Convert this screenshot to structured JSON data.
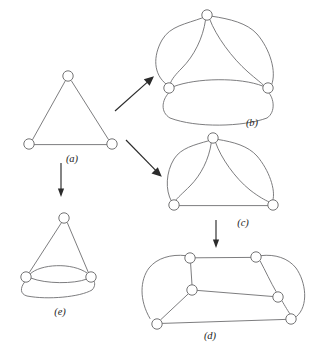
{
  "figure": {
    "background_color": "#ffffff",
    "edge_color": "#6e6e70",
    "node_color": "#ffffff",
    "node_stroke_color": "#6b6b6d",
    "arrow_color": "#2b2b2b",
    "label_color": "#1d1d1d",
    "node_radius": 5.2
  },
  "labels": {
    "a": "(a)",
    "b": "(b)",
    "c": "(c)",
    "d": "(d)",
    "e": "(e)"
  },
  "panels": [
    {
      "id": "a",
      "label": "(a)",
      "label_x": 72,
      "label_y": 162,
      "description": "simple triangle, three nodes, three single edges",
      "node_count": 3,
      "edge_count": 3,
      "nodes": [
        {
          "id": "a1",
          "cx": 68,
          "cy": 76
        },
        {
          "id": "a2",
          "cx": 29,
          "cy": 144
        },
        {
          "id": "a3",
          "cx": 112,
          "cy": 144
        }
      ],
      "edges": [
        {
          "from": "a1",
          "to": "a2",
          "kind": "straight"
        },
        {
          "from": "a1",
          "to": "a3",
          "kind": "straight"
        },
        {
          "from": "a2",
          "to": "a3",
          "kind": "straight"
        }
      ]
    },
    {
      "id": "b",
      "label": "(b)",
      "label_x": 252,
      "label_y": 126,
      "description": "triangle with every edge doubled (three pairs of parallel edges)",
      "node_count": 3,
      "edge_count": 6,
      "nodes": [
        {
          "id": "b1",
          "cx": 207,
          "cy": 15
        },
        {
          "id": "b2",
          "cx": 169,
          "cy": 88
        },
        {
          "id": "b3",
          "cx": 268,
          "cy": 88
        }
      ],
      "edges": [
        {
          "from": "b1",
          "to": "b2",
          "kind": "curve-left"
        },
        {
          "from": "b1",
          "to": "b2",
          "kind": "curve-right"
        },
        {
          "from": "b1",
          "to": "b3",
          "kind": "curve-left"
        },
        {
          "from": "b1",
          "to": "b3",
          "kind": "curve-right"
        },
        {
          "from": "b2",
          "to": "b3",
          "kind": "curve-up"
        },
        {
          "from": "b2",
          "to": "b3",
          "kind": "curve-down"
        }
      ]
    },
    {
      "id": "c",
      "label": "(c)",
      "label_x": 243,
      "label_y": 226,
      "description": "triangle with two upper edges doubled, base edge single",
      "node_count": 3,
      "edge_count": 5,
      "nodes": [
        {
          "id": "c1",
          "cx": 213,
          "cy": 138
        },
        {
          "id": "c2",
          "cx": 174,
          "cy": 205
        },
        {
          "id": "c3",
          "cx": 273,
          "cy": 205
        }
      ],
      "edges": [
        {
          "from": "c1",
          "to": "c2",
          "kind": "curve-left"
        },
        {
          "from": "c1",
          "to": "c2",
          "kind": "curve-right"
        },
        {
          "from": "c1",
          "to": "c3",
          "kind": "curve-left"
        },
        {
          "from": "c1",
          "to": "c3",
          "kind": "curve-right"
        },
        {
          "from": "c2",
          "to": "c3",
          "kind": "straight"
        }
      ]
    },
    {
      "id": "d",
      "label": "(d)",
      "label_x": 210,
      "label_y": 339,
      "description": "six-node expansion of (c) with outer enclosing curves",
      "node_count": 6,
      "edge_count": 9,
      "nodes": [
        {
          "id": "d1",
          "cx": 190,
          "cy": 258
        },
        {
          "id": "d2",
          "cx": 256,
          "cy": 257
        },
        {
          "id": "d3",
          "cx": 192,
          "cy": 290
        },
        {
          "id": "d4",
          "cx": 278,
          "cy": 297
        },
        {
          "id": "d5",
          "cx": 157,
          "cy": 324
        },
        {
          "id": "d6",
          "cx": 291,
          "cy": 319
        }
      ],
      "edges": [
        {
          "from": "d1",
          "to": "d2",
          "kind": "straight"
        },
        {
          "from": "d1",
          "to": "d3",
          "kind": "straight"
        },
        {
          "from": "d3",
          "to": "d4",
          "kind": "straight"
        },
        {
          "from": "d3",
          "to": "d5",
          "kind": "straight"
        },
        {
          "from": "d5",
          "to": "d6",
          "kind": "straight"
        },
        {
          "from": "d2",
          "to": "d4",
          "kind": "curve-right"
        },
        {
          "from": "d1",
          "to": "d5",
          "kind": "curve-left-outer"
        },
        {
          "from": "d2",
          "to": "d6",
          "kind": "curve-right-outer"
        },
        {
          "from": "d4",
          "to": "d6",
          "kind": "curve-right-inner"
        }
      ]
    },
    {
      "id": "e",
      "label": "(e)",
      "label_x": 60,
      "label_y": 315,
      "description": "triangle with base edge tripled",
      "node_count": 3,
      "edge_count": 5,
      "nodes": [
        {
          "id": "e1",
          "cx": 64,
          "cy": 218
        },
        {
          "id": "e2",
          "cx": 26,
          "cy": 277
        },
        {
          "id": "e3",
          "cx": 91,
          "cy": 277
        }
      ],
      "edges": [
        {
          "from": "e1",
          "to": "e2",
          "kind": "straight"
        },
        {
          "from": "e1",
          "to": "e3",
          "kind": "straight"
        },
        {
          "from": "e2",
          "to": "e3",
          "kind": "curve-up"
        },
        {
          "from": "e2",
          "to": "e3",
          "kind": "straight"
        },
        {
          "from": "e2",
          "to": "e3",
          "kind": "curve-down"
        }
      ]
    }
  ],
  "arrows": [
    {
      "id": "a-to-b",
      "from_panel": "a",
      "to_panel": "b",
      "direction": "up-right",
      "x1": 115,
      "y1": 111,
      "x2": 153,
      "y2": 77
    },
    {
      "id": "a-to-c",
      "from_panel": "a",
      "to_panel": "c",
      "direction": "down-right",
      "x1": 126,
      "y1": 140,
      "x2": 161,
      "y2": 176
    },
    {
      "id": "a-to-e",
      "from_panel": "a",
      "to_panel": "e",
      "direction": "down",
      "x1": 61,
      "y1": 163,
      "x2": 61,
      "y2": 196
    },
    {
      "id": "c-to-d",
      "from_panel": "c",
      "to_panel": "d",
      "direction": "down",
      "x1": 216,
      "y1": 220,
      "x2": 216,
      "y2": 247
    }
  ]
}
